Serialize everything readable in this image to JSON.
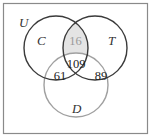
{
  "diagram": {
    "type": "venn",
    "universe_label": "U",
    "sets": [
      {
        "label": "C",
        "color": "#3a3a3a"
      },
      {
        "label": "T",
        "color": "#3a3a3a"
      },
      {
        "label": "D",
        "color": "#a0a0a0"
      }
    ],
    "regions": {
      "C_and_T_only": "16",
      "C_and_T_and_D": "109",
      "C_and_D_only": "61",
      "T_and_D_only": "89"
    },
    "shaded_region": "C_and_T_only",
    "shade_color": "#e4e4e4",
    "frame_color": "#8a8a8a"
  }
}
